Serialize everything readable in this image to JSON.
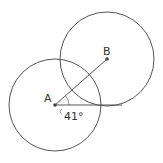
{
  "diagram": {
    "points": [
      {
        "label": "A",
        "x": 55,
        "y": 105
      },
      {
        "label": "B",
        "x": 107,
        "y": 59
      }
    ],
    "circles": [
      {
        "center": "A",
        "cx": 55,
        "cy": 105,
        "r": 46
      },
      {
        "center": "B",
        "cx": 107,
        "cy": 59,
        "r": 47
      }
    ],
    "angle_label": "41°",
    "colors": {
      "stroke": "#555555",
      "text": "#333333"
    }
  }
}
